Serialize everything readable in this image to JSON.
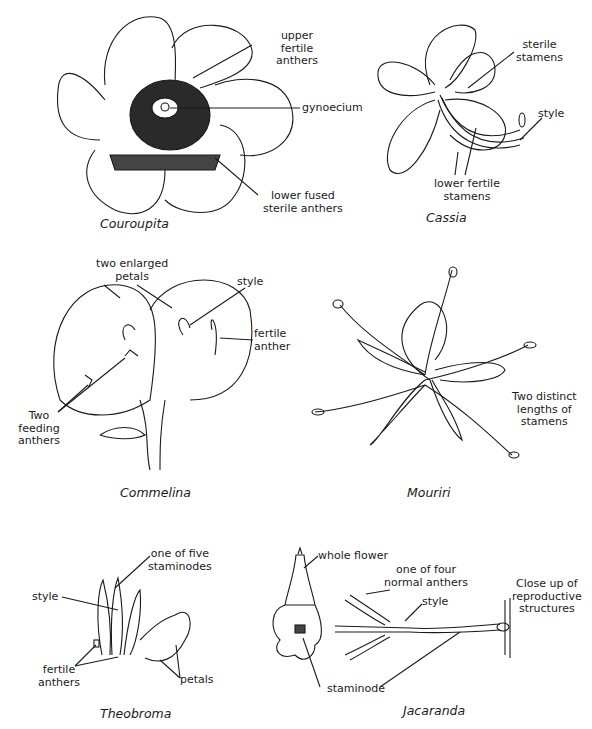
{
  "figure": {
    "panels": [
      {
        "name": "Couroupita",
        "labels": [
          "upper\nfertile\nanthers",
          "gynoecium",
          "lower fused\nsterile anthers"
        ]
      },
      {
        "name": "Cassia",
        "labels": [
          "sterile\nstamens",
          "style",
          "lower fertile\nstamens"
        ]
      },
      {
        "name": "Commelina",
        "labels": [
          "two enlarged\npetals",
          "style",
          "fertile\nanther",
          "Two\nfeeding\nanthers"
        ]
      },
      {
        "name": "Mouriri",
        "labels": [
          "Two distinct\nlengths of\nstamens"
        ]
      },
      {
        "name": "Theobroma",
        "labels": [
          "one of five\nstaminodes",
          "style",
          "fertile\nanthers",
          "petals"
        ]
      },
      {
        "name": "Jacaranda",
        "labels": [
          "whole flower",
          "one of four\nnormal anthers",
          "style",
          "Close up of\nreproductive\nstructures",
          "staminode"
        ]
      }
    ]
  }
}
